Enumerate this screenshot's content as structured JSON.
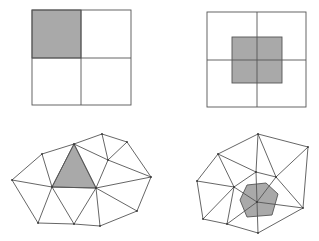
{
  "figure": {
    "panels": [
      {
        "id": "grid-cell-centered",
        "description": "2x2 square grid with top-left cell shaded",
        "outer": {
          "x": 32,
          "y": 10,
          "w": 99,
          "h": 95
        },
        "mid": {
          "x": 81,
          "y": 58
        },
        "shaded_rect": {
          "x": 32,
          "y": 10,
          "w": 49,
          "h": 48
        }
      },
      {
        "id": "grid-vertex-centered",
        "description": "2x2 square grid with dual cell shaded around center vertex",
        "outer": {
          "x": 207,
          "y": 12,
          "w": 99,
          "h": 95
        },
        "mid": {
          "x": 257,
          "y": 60
        },
        "shaded_rect": {
          "x": 232,
          "y": 37,
          "w": 50,
          "h": 46
        }
      },
      {
        "id": "tri-cell-centered",
        "description": "Triangular mesh with one triangle shaded",
        "vertices": [
          [
            12,
            180
          ],
          [
            42,
            154
          ],
          [
            74,
            144
          ],
          [
            102,
            134
          ],
          [
            127,
            142
          ],
          [
            151,
            177
          ],
          [
            137,
            211
          ],
          [
            100,
            226
          ],
          [
            74,
            224
          ],
          [
            38,
            223
          ],
          [
            52,
            187
          ],
          [
            96,
            188
          ],
          [
            108,
            160
          ]
        ],
        "edges": [
          [
            0,
            1
          ],
          [
            1,
            2
          ],
          [
            2,
            3
          ],
          [
            3,
            4
          ],
          [
            4,
            5
          ],
          [
            5,
            6
          ],
          [
            6,
            7
          ],
          [
            7,
            8
          ],
          [
            8,
            9
          ],
          [
            9,
            0
          ],
          [
            0,
            10
          ],
          [
            1,
            10
          ],
          [
            2,
            10
          ],
          [
            2,
            11
          ],
          [
            10,
            11
          ],
          [
            10,
            9
          ],
          [
            10,
            8
          ],
          [
            11,
            8
          ],
          [
            11,
            7
          ],
          [
            11,
            6
          ],
          [
            11,
            5
          ],
          [
            11,
            12
          ],
          [
            2,
            12
          ],
          [
            3,
            12
          ],
          [
            4,
            12
          ],
          [
            12,
            5
          ]
        ],
        "shaded_polygon": [
          [
            74,
            144
          ],
          [
            52,
            187
          ],
          [
            96,
            188
          ]
        ]
      },
      {
        "id": "tri-vertex-centered",
        "description": "Triangular mesh with dual control volume (polygon) shaded around a vertex",
        "vertices": [
          [
            258,
            134
          ],
          [
            308,
            147
          ],
          [
            218,
            154
          ],
          [
            197,
            181
          ],
          [
            276,
            177
          ],
          [
            234,
            187
          ],
          [
            256,
            172
          ],
          [
            257,
            202
          ],
          [
            303,
            208
          ],
          [
            203,
            219
          ],
          [
            227,
            224
          ],
          [
            258,
            233
          ]
        ],
        "edges": [
          [
            0,
            1
          ],
          [
            0,
            2
          ],
          [
            2,
            3
          ],
          [
            3,
            9
          ],
          [
            9,
            10
          ],
          [
            10,
            11
          ],
          [
            11,
            8
          ],
          [
            8,
            1
          ],
          [
            0,
            6
          ],
          [
            0,
            4
          ],
          [
            1,
            4
          ],
          [
            2,
            6
          ],
          [
            2,
            5
          ],
          [
            3,
            5
          ],
          [
            9,
            5
          ],
          [
            5,
            6
          ],
          [
            6,
            4
          ],
          [
            4,
            8
          ],
          [
            4,
            7
          ],
          [
            6,
            7
          ],
          [
            5,
            7
          ],
          [
            7,
            10
          ],
          [
            5,
            10
          ],
          [
            7,
            11
          ],
          [
            7,
            8
          ]
        ],
        "shaded_polygon": [
          [
            247,
            185
          ],
          [
            266,
            183
          ],
          [
            278,
            194
          ],
          [
            272,
            215
          ],
          [
            247,
            217
          ],
          [
            240,
            200
          ]
        ]
      }
    ],
    "colors": {
      "stroke": "#555555",
      "shade": "#a9a9a9",
      "background": "#ffffff"
    }
  }
}
